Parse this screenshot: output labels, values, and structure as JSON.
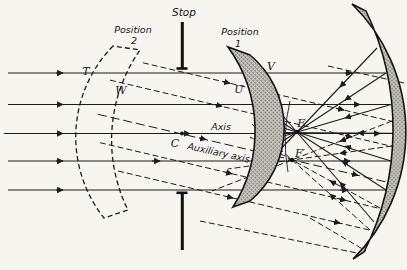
{
  "figure": {
    "background": "#f7f5ef",
    "ink": "#1c1c1c",
    "labels": {
      "stop": "Stop",
      "position2_word": "Position",
      "position2_num": "2",
      "position1_word": "Position",
      "position1_num": "1",
      "point_t": "T",
      "point_w": "W",
      "point_u": "U",
      "point_v": "V",
      "center_of_curvature": "C",
      "axis": "Axis",
      "auxiliary_axis": "Auxiliary axis",
      "focus": "F",
      "focus_prime": "F′"
    }
  }
}
